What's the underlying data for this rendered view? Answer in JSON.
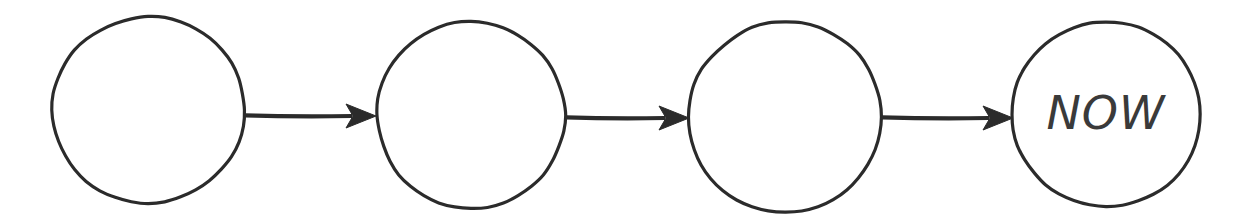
{
  "canvas": {
    "width": 1246,
    "height": 224,
    "background_color": "#ffffff",
    "ink_color": "#2b2b2b"
  },
  "diagram": {
    "kind": "sequence-of-circles-with-arrows",
    "style": "hand-drawn",
    "nodes": [
      {
        "id": "node-1",
        "label": "",
        "cx": 148,
        "cy": 110,
        "rx": 96,
        "ry": 93,
        "stroke_color": "#2b2b2b",
        "stroke_width": 3.2,
        "fill_color": "#ffffff"
      },
      {
        "id": "node-2",
        "label": "",
        "cx": 471,
        "cy": 115,
        "rx": 94,
        "ry": 93,
        "stroke_color": "#2b2b2b",
        "stroke_width": 3.2,
        "fill_color": "#ffffff"
      },
      {
        "id": "node-3",
        "label": "",
        "cx": 785,
        "cy": 117,
        "rx": 96,
        "ry": 95,
        "stroke_color": "#2b2b2b",
        "stroke_width": 3.2,
        "fill_color": "#ffffff"
      },
      {
        "id": "node-4",
        "label": "NOW",
        "cx": 1106,
        "cy": 114,
        "rx": 94,
        "ry": 92,
        "stroke_color": "#2b2b2b",
        "stroke_width": 3.2,
        "fill_color": "#ffffff",
        "label_font_size": 46,
        "label_color": "#3a3a3a"
      }
    ],
    "arrows": [
      {
        "id": "arrow-1",
        "from": "node-1",
        "to": "node-2",
        "x1": 245,
        "x2": 376,
        "y": 116,
        "stroke_color": "#2b2b2b",
        "stroke_width": 4.2,
        "head_length": 30,
        "head_half_width": 12
      },
      {
        "id": "arrow-2",
        "from": "node-2",
        "to": "node-3",
        "x1": 566,
        "x2": 689,
        "y": 118,
        "stroke_color": "#2b2b2b",
        "stroke_width": 4.2,
        "head_length": 30,
        "head_half_width": 12
      },
      {
        "id": "arrow-3",
        "from": "node-3",
        "to": "node-4",
        "x1": 882,
        "x2": 1013,
        "y": 118,
        "stroke_color": "#2b2b2b",
        "stroke_width": 4.2,
        "head_length": 30,
        "head_half_width": 12
      }
    ]
  }
}
